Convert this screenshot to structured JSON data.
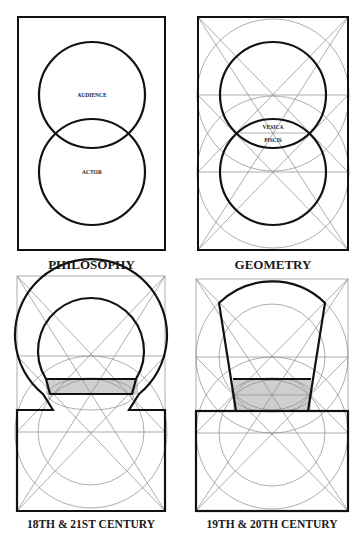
{
  "figure": {
    "panels": [
      {
        "id": "philosophy",
        "caption": "PHILOSOPHY",
        "labels": {
          "upper": "AUDIENCE",
          "lower": "ACTOR"
        }
      },
      {
        "id": "geometry",
        "caption": "GEOMETRY",
        "labels": {
          "upper": "VESICA",
          "lower": "PISCIS"
        }
      },
      {
        "id": "eighteenth-twentyfirst",
        "caption": "18TH & 21ST CENTURY"
      },
      {
        "id": "nineteenth-twentieth",
        "caption": "19TH & 20TH CENTURY"
      }
    ],
    "colors": {
      "line": "#111111",
      "construction": "#8a8a8a",
      "shade": "#cfcfcf",
      "background": "#ffffff"
    }
  }
}
